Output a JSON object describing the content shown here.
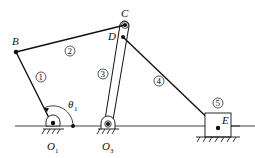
{
  "diagram": {
    "type": "planar-linkage-mechanism",
    "colors": {
      "line": "#111111",
      "background": "#ffffff"
    },
    "points": {
      "B": {
        "label": "B",
        "x": 16,
        "y": 52
      },
      "C": {
        "label": "C",
        "x": 125,
        "y": 25
      },
      "D": {
        "label": "D",
        "x": 123,
        "y": 37
      },
      "O1": {
        "label": "O",
        "sub": "1",
        "x": 53,
        "y": 126
      },
      "O3": {
        "label": "O",
        "sub": "3",
        "x": 108,
        "y": 126
      },
      "E": {
        "label": "E",
        "x": 218,
        "y": 128
      }
    },
    "links": [
      {
        "id": "1",
        "label": "1",
        "from": "O1",
        "to": "B"
      },
      {
        "id": "2",
        "label": "2",
        "from": "B",
        "to": "C"
      },
      {
        "id": "3",
        "label": "3",
        "from": "O3",
        "to": "C"
      },
      {
        "id": "4",
        "label": "4",
        "from": "D",
        "to": "E"
      },
      {
        "id": "5",
        "label": "5",
        "part": "slider"
      }
    ],
    "angle": {
      "label": "θ",
      "sub": "1",
      "vertex": "O1"
    }
  }
}
